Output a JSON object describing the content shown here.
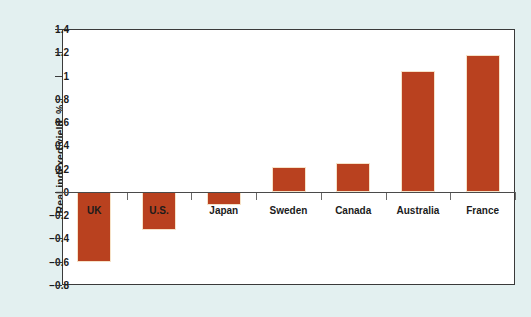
{
  "chart_data": {
    "type": "bar",
    "title": "",
    "xlabel": "",
    "ylabel": "Real indexed yield, %",
    "categories": [
      "UK",
      "U.S.",
      "Japan",
      "Sweden",
      "Canada",
      "Australia",
      "France"
    ],
    "values": [
      -0.6,
      -0.33,
      -0.11,
      0.21,
      0.25,
      1.04,
      1.18
    ],
    "ylim": [
      -0.8,
      1.4
    ],
    "yticks": [
      1.4,
      1.2,
      1,
      0.8,
      0.6,
      0.4,
      0.2,
      0,
      -0.2,
      -0.4,
      -0.6,
      -0.8
    ],
    "ytick_labels": [
      "1.4",
      "1.2",
      "1",
      "0.8",
      "0.6",
      "0.4",
      "0.2",
      "0",
      "−0.2",
      "−0.4",
      "−0.6",
      "−0.8"
    ],
    "grid": false,
    "legend": null,
    "bar_color": "#b9411f",
    "bar_edge_color": "#f6e2c8",
    "plot_background": "#ffffff",
    "figure_background": "#e3f0f0",
    "axis_color": "#3a3a3a",
    "label_inside_bar": [
      true,
      true,
      false,
      false,
      false,
      false,
      false
    ]
  }
}
